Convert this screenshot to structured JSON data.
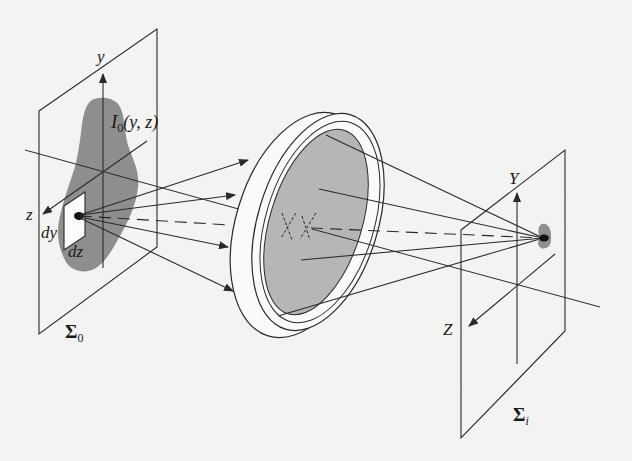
{
  "diagram": {
    "type": "optical imaging system (3D schematic)",
    "background": "#f3f3f1",
    "colors": {
      "line": "#2a2a2a",
      "object_fill": "#8e8e8e",
      "lens_fill": "#b3b3b3",
      "image_spot": "#8f8f8f"
    },
    "object_plane": {
      "name": "Σ",
      "subscript": "0",
      "axis_y_label": "y",
      "axis_z_label": "z",
      "irradiance_label_main": "I",
      "irradiance_label_sub": "0",
      "irradiance_label_args": "(y, z)",
      "element_dy_label": "dy",
      "element_dz_label": "dz"
    },
    "lens": {
      "description": "thick circular lens with gray aperture",
      "principal_point_markers": [
        "X",
        "X"
      ]
    },
    "image_plane": {
      "name": "Σ",
      "subscript": "i",
      "axis_y_label": "Y",
      "axis_z_label": "Z"
    },
    "rays": {
      "object_to_lens_count": 5,
      "lens_to_image_count": 5,
      "chief_ray_style": "dashed"
    }
  }
}
